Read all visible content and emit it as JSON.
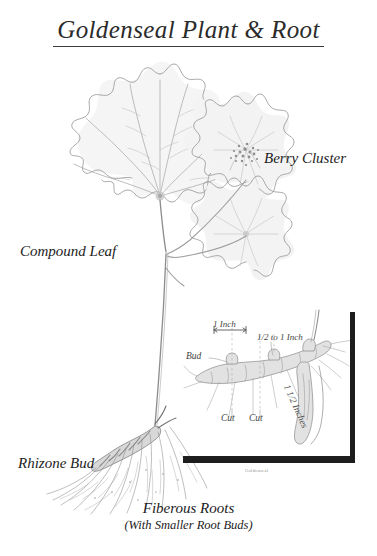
{
  "page": {
    "title": "Goldenseal Plant & Root",
    "background_color": "#ffffff",
    "ink_color": "#1c1c1c"
  },
  "labels": {
    "compound_leaf": "Compound Leaf",
    "berry_cluster": "Berry Cluster",
    "rhizone_bud": "Rhizone Bud"
  },
  "caption": {
    "main": "Fiberous Roots",
    "sub": "(With Smaller Root Buds)"
  },
  "inset": {
    "bud": "Bud",
    "one_inch": "1 Inch",
    "half_to_one_inch": "1/2 to 1 Inch",
    "cut_left": "Cut",
    "cut_right": "Cut",
    "one_and_half_inches": "1 1/2 Inches",
    "credit": "Goldenseal"
  },
  "illustration": {
    "subject": "Goldenseal (Hydrastis canadensis) pencil botanical drawing",
    "medium": "graphite pencil sketch",
    "parts": [
      "compound palmate leaf",
      "berry cluster",
      "second compound leaf",
      "stem",
      "rhizome with bud",
      "fiberous roots"
    ]
  }
}
